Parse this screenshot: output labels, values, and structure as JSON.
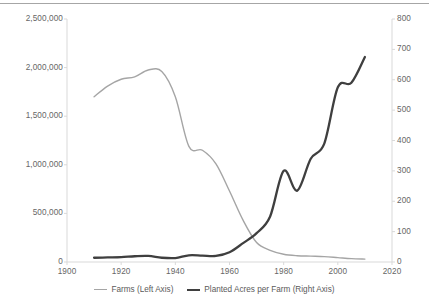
{
  "chart_data": {
    "type": "line",
    "title": "",
    "xlabel": "",
    "ylabel": "",
    "grid": false,
    "legend_position": "bottom",
    "x": [
      1910,
      1915,
      1920,
      1925,
      1930,
      1935,
      1940,
      1945,
      1950,
      1955,
      1960,
      1965,
      1970,
      1975,
      1980,
      1985,
      1990,
      1995,
      2000,
      2005,
      2010
    ],
    "xlim": [
      1900,
      2020
    ],
    "xticks": [
      "1900",
      "1920",
      "1940",
      "1960",
      "1980",
      "2000",
      "2020"
    ],
    "xtick_values": [
      1900,
      1920,
      1940,
      1960,
      1980,
      2000,
      2020
    ],
    "axes": [
      {
        "id": "left",
        "name": "Farms (Left Axis)",
        "ylim": [
          0,
          2500000
        ],
        "yticks": [
          "0",
          "500,000",
          "1,000,000",
          "1,500,000",
          "2,000,000",
          "2,500,000"
        ],
        "ytick_values": [
          0,
          500000,
          1000000,
          1500000,
          2000000,
          2500000
        ],
        "color": "#a5a5a5"
      },
      {
        "id": "right",
        "name": "Planted Acres per Farm (Right Axis)",
        "ylim": [
          0,
          800
        ],
        "yticks": [
          "0",
          "100",
          "200",
          "300",
          "400",
          "500",
          "600",
          "700",
          "800"
        ],
        "ytick_values": [
          0,
          100,
          200,
          300,
          400,
          500,
          600,
          700,
          800
        ],
        "color": "#3f3f3f"
      }
    ],
    "series": [
      {
        "name": "Farms (Left Axis)",
        "axis": "left",
        "color": "#a5a5a5",
        "line_width": 1.4,
        "values": [
          1700000,
          1810000,
          1880000,
          1905000,
          1975000,
          1960000,
          1700000,
          1190000,
          1150000,
          1010000,
          730000,
          430000,
          200000,
          120000,
          80000,
          65000,
          60000,
          55000,
          45000,
          35000,
          30000
        ]
      },
      {
        "name": "Planted Acres per Farm (Right Axis)",
        "axis": "right",
        "color": "#3f3f3f",
        "line_width": 2.3,
        "values": [
          14,
          15,
          16,
          19,
          20,
          14,
          13,
          22,
          21,
          20,
          32,
          62,
          95,
          150,
          300,
          235,
          340,
          390,
          575,
          590,
          675
        ]
      }
    ],
    "annotations": {
      "crossover_year": 1964,
      "crossover_farms": 200000,
      "crossover_acres": 64
    }
  },
  "legend": {
    "items": [
      {
        "label": "Farms (Left Axis)",
        "color": "#a5a5a5",
        "style": "thin"
      },
      {
        "label": "Planted Acres per Farm (Right Axis)",
        "color": "#3f3f3f",
        "style": "thick"
      }
    ]
  }
}
